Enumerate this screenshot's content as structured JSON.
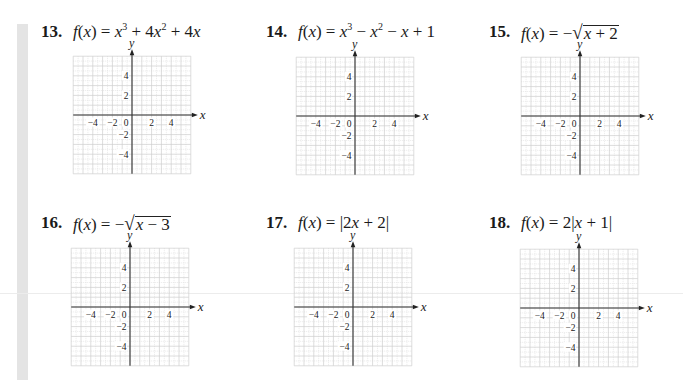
{
  "page": {
    "problems": [
      {
        "number": "13.",
        "lhs": "f(x) = ",
        "expression": "x^3 + 4x^2 + 4x",
        "parts": [
          {
            "t": "x",
            "i": true
          },
          {
            "t": "3",
            "sup": true
          },
          {
            "t": " + 4"
          },
          {
            "t": "x",
            "i": true
          },
          {
            "t": "2",
            "sup": true
          },
          {
            "t": " + 4"
          },
          {
            "t": "x",
            "i": true
          }
        ]
      },
      {
        "number": "14.",
        "lhs": "f(x) = ",
        "expression": "x^3 − x^2 − x + 1",
        "parts": [
          {
            "t": "x",
            "i": true
          },
          {
            "t": "3",
            "sup": true
          },
          {
            "t": " − "
          },
          {
            "t": "x",
            "i": true
          },
          {
            "t": "2",
            "sup": true
          },
          {
            "t": " − "
          },
          {
            "t": "x",
            "i": true
          },
          {
            "t": " + 1"
          }
        ]
      },
      {
        "number": "15.",
        "lhs": "f(x) = ",
        "expression": "−√(x + 2)",
        "sqrt": {
          "prefix": "−",
          "radicand": "x + 2"
        }
      },
      {
        "number": "16.",
        "lhs": "f(x) = ",
        "expression": "−√(x − 3)",
        "sqrt": {
          "prefix": "−",
          "radicand": "x − 3"
        }
      },
      {
        "number": "17.",
        "lhs": "f(x) = ",
        "expression": "|2x + 2|",
        "parts": [
          {
            "t": "|2"
          },
          {
            "t": "x",
            "i": true
          },
          {
            "t": " + 2|"
          }
        ]
      },
      {
        "number": "18.",
        "lhs": "f(x) = ",
        "expression": "2|x + 1|",
        "parts": [
          {
            "t": "2|"
          },
          {
            "t": "x",
            "i": true
          },
          {
            "t": " + 1|"
          }
        ]
      }
    ]
  },
  "chart_data": [
    {
      "type": "line",
      "title": "13. f(x) = x^3 + 4x^2 + 4x",
      "xlabel": "x",
      "ylabel": "y",
      "xlim": [
        -6,
        6
      ],
      "ylim": [
        -6,
        6
      ],
      "grid": true,
      "x_ticks": [
        -4,
        -2,
        0,
        2,
        4
      ],
      "y_ticks": [
        4,
        2,
        -2,
        -4
      ],
      "series": []
    },
    {
      "type": "line",
      "title": "14. f(x) = x^3 − x^2 − x + 1",
      "xlabel": "x",
      "ylabel": "y",
      "xlim": [
        -6,
        6
      ],
      "ylim": [
        -6,
        6
      ],
      "grid": true,
      "x_ticks": [
        -4,
        -2,
        0,
        2,
        4
      ],
      "y_ticks": [
        4,
        2,
        -2,
        -4
      ],
      "series": []
    },
    {
      "type": "line",
      "title": "15. f(x) = −√(x + 2)",
      "xlabel": "x",
      "ylabel": "y",
      "xlim": [
        -6,
        6
      ],
      "ylim": [
        -6,
        6
      ],
      "grid": true,
      "x_ticks": [
        -4,
        -2,
        0,
        2,
        4
      ],
      "y_ticks": [
        4,
        2,
        -2,
        -4
      ],
      "series": []
    },
    {
      "type": "line",
      "title": "16. f(x) = −√(x − 3)",
      "xlabel": "x",
      "ylabel": "y",
      "xlim": [
        -6,
        6
      ],
      "ylim": [
        -6,
        6
      ],
      "grid": true,
      "x_ticks": [
        -4,
        -2,
        0,
        2,
        4
      ],
      "y_ticks": [
        4,
        2,
        -2,
        -4
      ],
      "series": []
    },
    {
      "type": "line",
      "title": "17. f(x) = |2x + 2|",
      "xlabel": "x",
      "ylabel": "y",
      "xlim": [
        -6,
        6
      ],
      "ylim": [
        -6,
        6
      ],
      "grid": true,
      "x_ticks": [
        -4,
        -2,
        0,
        2,
        4
      ],
      "y_ticks": [
        4,
        2,
        -2,
        -4
      ],
      "series": []
    },
    {
      "type": "line",
      "title": "18. f(x) = 2|x + 1|",
      "xlabel": "x",
      "ylabel": "y",
      "xlim": [
        -6,
        6
      ],
      "ylim": [
        -6,
        6
      ],
      "grid": true,
      "x_ticks": [
        -4,
        -2,
        0,
        2,
        4
      ],
      "y_ticks": [
        4,
        2,
        -2,
        -4
      ],
      "series": []
    }
  ]
}
